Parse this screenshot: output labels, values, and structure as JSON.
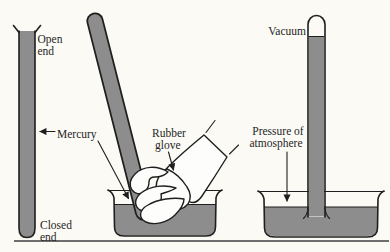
{
  "colors": {
    "background": "#fbfaf5",
    "ink": "#1f1f1f",
    "mercury": "#8d8d8d",
    "baseline": "#6e6e6e"
  },
  "labels": {
    "open_end_line1": "Open",
    "open_end_line2": "end",
    "closed_end_line1": "Closed",
    "closed_end_line2": "end",
    "mercury": "Mercury",
    "rubber_glove_line1": "Rubber",
    "rubber_glove_line2": "glove",
    "vacuum": "Vacuum",
    "pressure_line1": "Pressure of",
    "pressure_line2": "atmosphere"
  }
}
